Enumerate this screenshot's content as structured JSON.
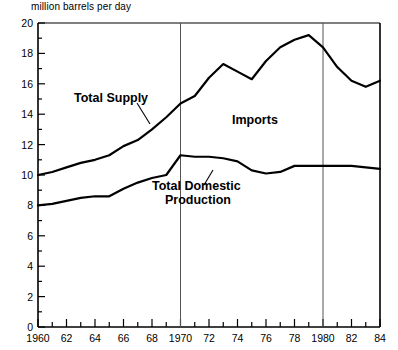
{
  "chart_data": {
    "type": "line",
    "title": "",
    "ylabel": "million barrels per day",
    "xlabel": "",
    "xlim": [
      1960,
      1984
    ],
    "ylim": [
      0,
      20
    ],
    "ytick_step": 2,
    "yminor_step": 1,
    "xtick_step": 1,
    "xlabel_step": 2,
    "grid": false,
    "legend": "inline-annotations",
    "reference_lines": [
      1970,
      1980
    ],
    "x": [
      1960,
      1961,
      1962,
      1963,
      1964,
      1965,
      1966,
      1967,
      1968,
      1969,
      1970,
      1971,
      1972,
      1973,
      1974,
      1975,
      1976,
      1977,
      1978,
      1979,
      1980,
      1981,
      1982,
      1983,
      1984
    ],
    "series": [
      {
        "name": "Total Supply",
        "values": [
          10.0,
          10.2,
          10.5,
          10.8,
          11.0,
          11.3,
          11.9,
          12.3,
          13.0,
          13.8,
          14.7,
          15.2,
          16.4,
          17.3,
          16.8,
          16.3,
          17.5,
          18.4,
          18.9,
          19.2,
          18.4,
          17.1,
          16.2,
          15.8,
          16.2
        ]
      },
      {
        "name": "Total Domestic Production",
        "values": [
          8.0,
          8.1,
          8.3,
          8.5,
          8.6,
          8.6,
          9.1,
          9.5,
          9.8,
          10.0,
          11.3,
          11.2,
          11.2,
          11.1,
          10.9,
          10.3,
          10.1,
          10.2,
          10.6,
          10.6,
          10.6,
          10.6,
          10.6,
          10.5,
          10.4
        ]
      }
    ],
    "annotations": [
      {
        "id": "total-supply-label",
        "text": "Total Supply"
      },
      {
        "id": "imports-label",
        "text": "Imports"
      },
      {
        "id": "domestic-line1",
        "text": "Total Domestic"
      },
      {
        "id": "domestic-line2",
        "text": "Production"
      }
    ],
    "ytick_labels": [
      "0",
      "2",
      "4",
      "6",
      "8",
      "10",
      "12",
      "14",
      "16",
      "18",
      "20"
    ],
    "xtick_labels": [
      "1960",
      "62",
      "64",
      "66",
      "68",
      "1970",
      "72",
      "74",
      "76",
      "78",
      "1980",
      "82",
      "84"
    ],
    "colors": {
      "line": "#000000",
      "axis": "#000000",
      "reference_line": "#555555",
      "background": "#ffffff"
    }
  }
}
